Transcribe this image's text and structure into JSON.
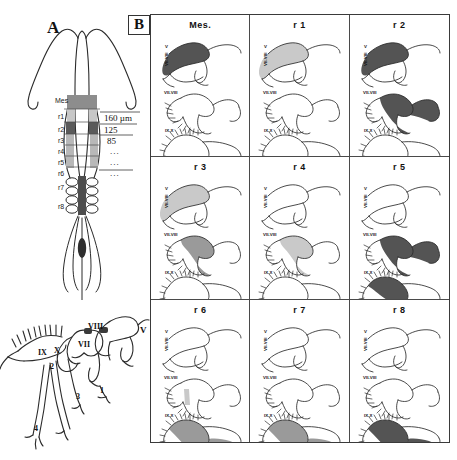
{
  "figure": {
    "panels": [
      {
        "id": "A",
        "letter": "A"
      },
      {
        "id": "B",
        "letter": "B"
      }
    ]
  },
  "panel_a": {
    "letter": "A",
    "segment_labels": [
      "Mes",
      "r1",
      "r2",
      "r3",
      "r4",
      "r5",
      "r6",
      "r7",
      "r8"
    ],
    "measurements": [
      {
        "value": "160 µm"
      },
      {
        "value": "125"
      },
      {
        "value": "85"
      },
      {
        "value": "..."
      },
      {
        "value": "..."
      },
      {
        "value": "..."
      }
    ],
    "nerve_labels": [
      "V",
      "VIII",
      "VII",
      "IX",
      "X"
    ],
    "branch_labels": [
      "1",
      "2",
      "3",
      "4"
    ]
  },
  "panel_b": {
    "letter": "B",
    "ganglion_labels": [
      "V",
      "VII-VIII",
      "IX-X"
    ],
    "cells": [
      {
        "title": "Mes.",
        "v_shade": "dark",
        "vii_shade": "none",
        "ix_shade": "none"
      },
      {
        "title": "r 1",
        "v_shade": "light",
        "vii_shade": "none",
        "ix_shade": "none"
      },
      {
        "title": "r 2",
        "v_shade": "dark",
        "vii_shade": "dark",
        "ix_shade": "none"
      },
      {
        "title": "r 3",
        "v_shade": "light",
        "vii_shade": "medium",
        "ix_shade": "none"
      },
      {
        "title": "r 4",
        "v_shade": "none",
        "vii_shade": "light",
        "ix_shade": "none"
      },
      {
        "title": "r 5",
        "v_shade": "none",
        "vii_shade": "dark",
        "ix_shade": "darktop"
      },
      {
        "title": "r 6",
        "v_shade": "none",
        "vii_shade": "lightbar",
        "ix_shade": "medium"
      },
      {
        "title": "r 7",
        "v_shade": "none",
        "vii_shade": "none",
        "ix_shade": "medium2"
      },
      {
        "title": "r 8",
        "v_shade": "none",
        "vii_shade": "none",
        "ix_shade": "dark"
      }
    ]
  },
  "colors": {
    "outline": "#2b2b2b",
    "shade_light": "#c9c9c9",
    "shade_medium": "#9a9a9a",
    "shade_dark": "#545454",
    "border": "#3a3a3a"
  }
}
